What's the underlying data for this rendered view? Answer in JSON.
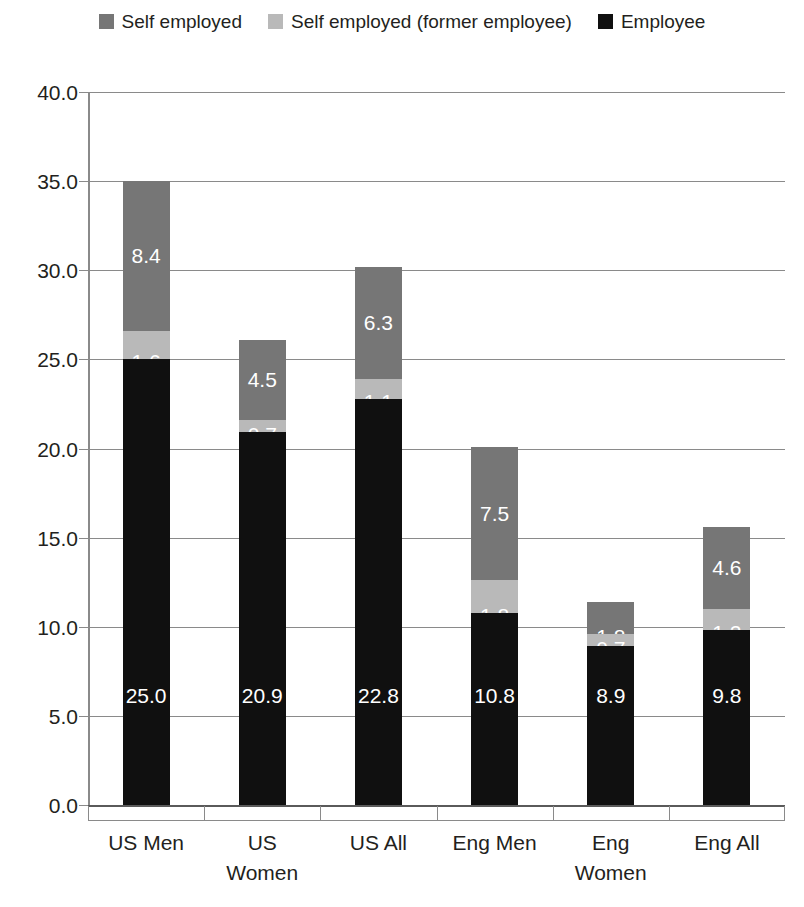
{
  "legend": {
    "items": [
      {
        "label": "Self employed",
        "color": "#767676",
        "icon": "legend-swatch-self-employed"
      },
      {
        "label": "Self employed (former employee)",
        "color": "#b9b9b9",
        "icon": "legend-swatch-self-employed-former"
      },
      {
        "label": "Employee",
        "color": "#101010",
        "icon": "legend-swatch-employee"
      }
    ]
  },
  "axis": {
    "y_ticks": [
      "0.0",
      "5.0",
      "10.0",
      "15.0",
      "20.0",
      "25.0",
      "30.0",
      "35.0",
      "40.0"
    ],
    "x_labels": [
      {
        "line1": "US Men",
        "line2": ""
      },
      {
        "line1": "US",
        "line2": "Women"
      },
      {
        "line1": "US All",
        "line2": ""
      },
      {
        "line1": "Eng Men",
        "line2": ""
      },
      {
        "line1": "Eng",
        "line2": "Women"
      },
      {
        "line1": "Eng All",
        "line2": ""
      }
    ]
  },
  "chart_data": {
    "type": "bar",
    "stacked": true,
    "title": "",
    "xlabel": "",
    "ylabel": "",
    "ylim": [
      0,
      40
    ],
    "ytick_step": 5,
    "grid": true,
    "legend_position": "top",
    "categories": [
      "US Men",
      "US Women",
      "US All",
      "Eng Men",
      "Eng Women",
      "Eng All"
    ],
    "series": [
      {
        "name": "Employee",
        "color": "#101010",
        "values": [
          25.0,
          20.9,
          22.8,
          10.8,
          8.9,
          9.8
        ],
        "labels": [
          "25.0",
          "20.9",
          "22.8",
          "10.8",
          "8.9",
          "9.8"
        ]
      },
      {
        "name": "Self employed (former employee)",
        "color": "#b9b9b9",
        "values": [
          1.6,
          0.7,
          1.1,
          1.8,
          0.7,
          1.2
        ],
        "labels": [
          "1.6",
          "0.7",
          "1.1",
          "1.8",
          "0.7",
          "1.2"
        ]
      },
      {
        "name": "Self employed",
        "color": "#767676",
        "values": [
          8.4,
          4.5,
          6.3,
          7.5,
          1.8,
          4.6
        ],
        "labels": [
          "8.4",
          "4.5",
          "6.3",
          "7.5",
          "1.8",
          "4.6"
        ]
      }
    ],
    "totals": [
      35.0,
      26.1,
      30.2,
      20.1,
      11.4,
      15.6
    ]
  }
}
